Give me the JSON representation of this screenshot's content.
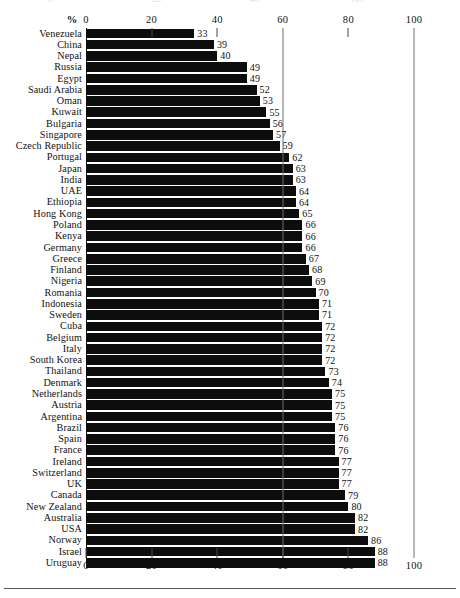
{
  "chart_data": {
    "type": "bar",
    "orientation": "horizontal",
    "title": "",
    "subtitle": "",
    "xlabel": "%",
    "ylabel": "",
    "xlim": [
      0,
      100
    ],
    "xticks": [
      0,
      20,
      40,
      60,
      80,
      100
    ],
    "xtick_labels": [
      "0",
      "20",
      "40",
      "60",
      "80",
      "100"
    ],
    "grid": "vertical gridlines at 60 and 100",
    "axis_positions": [
      "top",
      "bottom"
    ],
    "legend": "none",
    "value_labels": true,
    "bar_color": "#0d0d0d",
    "categories": [
      "Venezuela",
      "China",
      "Nepal",
      "Russia",
      "Egypt",
      "Saudi Arabia",
      "Oman",
      "Kuwait",
      "Bulgaria",
      "Singapore",
      "Czech Republic",
      "Portugal",
      "Japan",
      "India",
      "UAE",
      "Ethiopia",
      "Hong Kong",
      "Poland",
      "Kenya",
      "Germany",
      "Greece",
      "Finland",
      "Nigeria",
      "Romania",
      "Indonesia",
      "Sweden",
      "Cuba",
      "Belgium",
      "Italy",
      "South Korea",
      "Thailand",
      "Denmark",
      "Netherlands",
      "Austria",
      "Argentina",
      "Brazil",
      "Spain",
      "France",
      "Ireland",
      "Switzerland",
      "UK",
      "Canada",
      "New Zealand",
      "Australia",
      "USA",
      "Norway",
      "Israel",
      "Uruguay"
    ],
    "values": [
      33,
      39,
      40,
      49,
      49,
      52,
      53,
      55,
      56,
      57,
      59,
      62,
      63,
      63,
      64,
      64,
      65,
      66,
      66,
      66,
      67,
      68,
      69,
      70,
      71,
      71,
      72,
      72,
      72,
      72,
      73,
      74,
      75,
      75,
      75,
      76,
      76,
      76,
      77,
      77,
      77,
      79,
      80,
      82,
      82,
      86,
      88,
      88
    ]
  },
  "axis": {
    "percent_symbol": "%"
  }
}
